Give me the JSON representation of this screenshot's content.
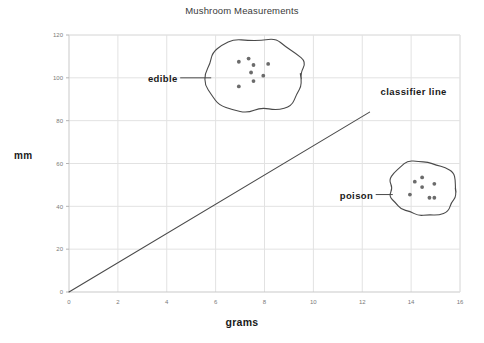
{
  "chart_data": {
    "type": "scatter",
    "title": "Mushroom Measurements",
    "xlabel": "grams",
    "ylabel": "mm",
    "xlim": [
      0,
      16
    ],
    "ylim": [
      0,
      120
    ],
    "xticks": [
      "0",
      "2",
      "4",
      "6",
      "8",
      "10",
      "12",
      "14",
      "16"
    ],
    "xtick_values": [
      0,
      2,
      4,
      6,
      8,
      10,
      12,
      14,
      16
    ],
    "yticks": [
      "0",
      "20",
      "40",
      "60",
      "80",
      "100",
      "120"
    ],
    "ytick_values": [
      0,
      20,
      40,
      60,
      80,
      100,
      120
    ],
    "grid": true,
    "grid_color": "#e2e2e2",
    "legend": "none",
    "marker_color": "#6b6b6b",
    "line_color": "#4a4a4a",
    "series": [
      {
        "name": "edible",
        "label": "edible",
        "points": [
          {
            "x": 6.95,
            "y": 107.5
          },
          {
            "x": 7.35,
            "y": 109.0
          },
          {
            "x": 7.55,
            "y": 106.0
          },
          {
            "x": 8.15,
            "y": 106.5
          },
          {
            "x": 7.45,
            "y": 102.5
          },
          {
            "x": 7.95,
            "y": 101.0
          },
          {
            "x": 7.55,
            "y": 98.5
          },
          {
            "x": 6.95,
            "y": 96.0
          }
        ]
      },
      {
        "name": "poison",
        "label": "poison",
        "points": [
          {
            "x": 14.45,
            "y": 53.5
          },
          {
            "x": 14.15,
            "y": 51.5
          },
          {
            "x": 14.95,
            "y": 50.5
          },
          {
            "x": 14.45,
            "y": 49.0
          },
          {
            "x": 13.95,
            "y": 45.5
          },
          {
            "x": 14.75,
            "y": 44.0
          },
          {
            "x": 14.95,
            "y": 44.0
          }
        ]
      }
    ],
    "annotations": [
      {
        "name": "classifier-line",
        "text": "classifier line",
        "x": 12.6,
        "y": 90
      },
      {
        "name": "edible-label",
        "text": "edible",
        "x": 4.4,
        "y": 100
      },
      {
        "name": "poison-label",
        "text": "poison",
        "x": 12.4,
        "y": 45
      }
    ],
    "classifier_line": {
      "label": "classifier line",
      "from": {
        "x": 0,
        "y": 0
      },
      "to": {
        "x": 12.3,
        "y": 84
      },
      "slope": 6.83
    }
  }
}
